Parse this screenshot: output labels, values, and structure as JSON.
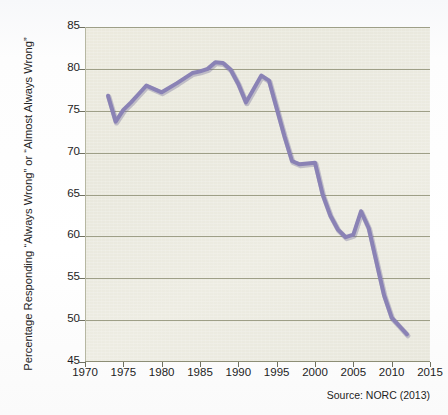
{
  "title_fragment": "yearly average of responses on extramarital relations",
  "source_note": "Source: NORC (2013)",
  "axis": {
    "y_label": "Percentage Responding “Always Wrong” or “Almost Always Wrong”",
    "y_ticks": [
      "45",
      "50",
      "55",
      "60",
      "65",
      "70",
      "75",
      "80",
      "85"
    ],
    "x_ticks": [
      "1970",
      "1975",
      "1980",
      "1985",
      "1990",
      "1995",
      "2000",
      "2005",
      "2010",
      "2015"
    ]
  },
  "colors": {
    "line": "#8a82b5",
    "line_shadow": "#6e6796",
    "plot_background": "#eae9de",
    "gridline": "#9a9b82",
    "text": "#1d1d1d"
  },
  "chart_data": {
    "type": "line",
    "title": "",
    "xlabel": "",
    "ylabel": "Percentage Responding “Always Wrong” or “Almost Always Wrong”",
    "xlim": [
      1970,
      2015
    ],
    "ylim": [
      45,
      85
    ],
    "grid": true,
    "legend": false,
    "series": [
      {
        "name": "Percentage Responding “Always Wrong” or “Almost Always Wrong”",
        "points": [
          [
            1973,
            76.8
          ],
          [
            1974,
            73.7
          ],
          [
            1975,
            75.1
          ],
          [
            1976,
            76.0
          ],
          [
            1977,
            77.0
          ],
          [
            1978,
            78.0
          ],
          [
            1980,
            77.2
          ],
          [
            1982,
            78.3
          ],
          [
            1983,
            78.9
          ],
          [
            1984,
            79.5
          ],
          [
            1985,
            79.7
          ],
          [
            1986,
            80.0
          ],
          [
            1987,
            80.8
          ],
          [
            1988,
            80.7
          ],
          [
            1989,
            79.9
          ],
          [
            1990,
            78.2
          ],
          [
            1991,
            76.0
          ],
          [
            1993,
            79.2
          ],
          [
            1994,
            78.6
          ],
          [
            1996,
            72.0
          ],
          [
            1997,
            69.0
          ],
          [
            1998,
            68.6
          ],
          [
            2000,
            68.8
          ],
          [
            2001,
            65.0
          ],
          [
            2002,
            62.5
          ],
          [
            2003,
            60.8
          ],
          [
            2004,
            59.9
          ],
          [
            2005,
            60.2
          ],
          [
            2006,
            63.0
          ],
          [
            2007,
            61.0
          ],
          [
            2008,
            57.0
          ],
          [
            2009,
            53.0
          ],
          [
            2010,
            50.3
          ],
          [
            2011,
            49.3
          ],
          [
            2012,
            48.3
          ]
        ]
      }
    ]
  }
}
